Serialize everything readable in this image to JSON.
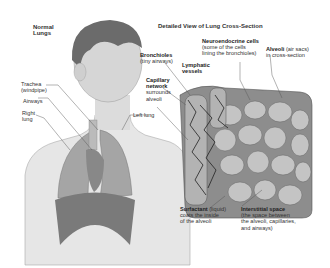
{
  "figure": {
    "left_title": [
      "Normal",
      "Lungs"
    ],
    "right_title": "Detailed View of Lung Cross-Section"
  },
  "labels": {
    "trachea": {
      "bold": "",
      "lines": [
        "Trachea",
        "(windpipe)"
      ]
    },
    "airways": {
      "lines": [
        "Airways"
      ]
    },
    "right_lung": {
      "lines": [
        "Right",
        "lung"
      ]
    },
    "left_lung": {
      "lines": [
        "Left lung"
      ]
    },
    "bronchioles": {
      "bold": "Bronchioles",
      "lines": [
        "(tiny airways)"
      ]
    },
    "lymphatic": {
      "bold": "Lymphatic",
      "bold2": "vessels"
    },
    "capillary": {
      "bold": "Capillary",
      "bold2": "network",
      "lines": [
        "surrounds",
        "alveoli"
      ]
    },
    "neuroendocrine": {
      "bold": "Neuroendocrine cells",
      "lines": [
        "(some of the cells",
        "lining the bronchioles)"
      ]
    },
    "alveoli": {
      "bold": "Alveoli",
      "rest": " (air sacs)",
      "lines": [
        "in cross-section"
      ]
    },
    "surfactant": {
      "bold": "Surfactant",
      "rest": " (liquid)",
      "lines": [
        "coats the inside",
        "of the alveoli"
      ]
    },
    "interstitial": {
      "bold": "Interstitial space",
      "lines": [
        "(the space between",
        "the alveoli, capillaries,",
        "and airways)"
      ]
    }
  },
  "colors": {
    "ink": "#333333",
    "skin": "#d9d9d9",
    "lung": "#9a9a9a",
    "tissue": "#7d7d7d",
    "background": "#ffffff"
  }
}
